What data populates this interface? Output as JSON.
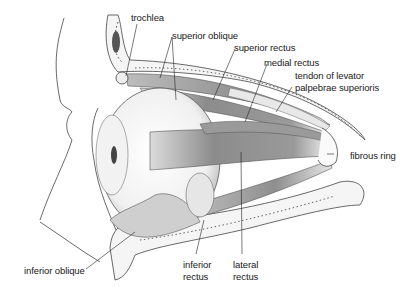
{
  "diagram": {
    "labels": [
      {
        "id": "trochlea",
        "text": "trochlea"
      },
      {
        "id": "superior_oblique",
        "text": "superior oblique"
      },
      {
        "id": "superior_rectus",
        "text": "superior rectus"
      },
      {
        "id": "medial_rectus",
        "text": "medial rectus"
      },
      {
        "id": "tendon_levator_1",
        "text": "tendon of levator"
      },
      {
        "id": "tendon_levator_2",
        "text": "palpebrae superioris"
      },
      {
        "id": "fibrous_ring",
        "text": "fibrous ring"
      },
      {
        "id": "inferior_oblique",
        "text": "inferior oblique"
      },
      {
        "id": "inferior_rectus_1",
        "text": "inferior"
      },
      {
        "id": "inferior_rectus_2",
        "text": "rectus"
      },
      {
        "id": "lateral_rectus_1",
        "text": "lateral"
      },
      {
        "id": "lateral_rectus_2",
        "text": "rectus"
      }
    ],
    "colors": {
      "ink": "#1a1a1a",
      "muscle": "#8a8a8a",
      "bone": "#f4f4f4",
      "line": "#555555"
    }
  }
}
